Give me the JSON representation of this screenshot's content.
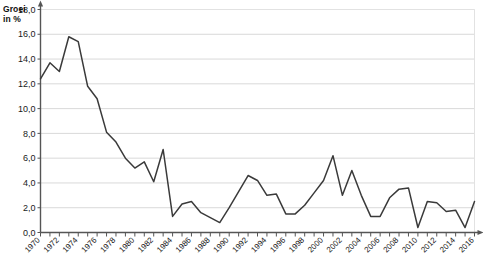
{
  "labels": {
    "axis_title_line1": "Groei",
    "axis_title_line2": "in %"
  },
  "chart_data": {
    "type": "line",
    "title": "",
    "subtitle": "",
    "xlabel": "",
    "ylabel": "Groei in %",
    "ylim": [
      0.0,
      18.0
    ],
    "ytick_step": 2.0,
    "ytick_labels": [
      "0,0",
      "2,0",
      "4,0",
      "6,0",
      "8,0",
      "10,0",
      "12,0",
      "14,0",
      "16,0",
      "18,0"
    ],
    "ytick_values": [
      0.0,
      2.0,
      4.0,
      6.0,
      8.0,
      10.0,
      12.0,
      14.0,
      16.0,
      18.0
    ],
    "xlim": [
      1970,
      2016
    ],
    "xtick_label_step": 2,
    "xtick_labels": [
      "1970",
      "1972",
      "1974",
      "1976",
      "1978",
      "1980",
      "1982",
      "1984",
      "1986",
      "1988",
      "1990",
      "1992",
      "1994",
      "1996",
      "1998",
      "2000",
      "2002",
      "2004",
      "2006",
      "2008",
      "2010",
      "2012",
      "2014",
      "2016"
    ],
    "grid": "horizontal",
    "legend_position": "none",
    "line_color": "#3a3a3a",
    "grid_color": "#d9d9d9",
    "axis_color": "#555555",
    "x": [
      1970,
      1971,
      1972,
      1973,
      1974,
      1975,
      1976,
      1977,
      1978,
      1979,
      1980,
      1981,
      1982,
      1983,
      1984,
      1985,
      1986,
      1987,
      1988,
      1989,
      1990,
      1991,
      1992,
      1993,
      1994,
      1995,
      1996,
      1997,
      1998,
      1999,
      2000,
      2001,
      2002,
      2003,
      2004,
      2005,
      2006,
      2007,
      2008,
      2009,
      2010,
      2011,
      2012,
      2013,
      2014,
      2015,
      2016
    ],
    "values": [
      12.4,
      13.7,
      13.0,
      15.8,
      15.4,
      11.8,
      10.8,
      8.1,
      7.3,
      6.0,
      5.2,
      5.7,
      4.1,
      6.7,
      1.3,
      2.3,
      2.5,
      1.6,
      1.2,
      0.8,
      2.0,
      3.3,
      4.6,
      4.2,
      3.0,
      3.1,
      1.5,
      1.5,
      2.2,
      3.2,
      4.2,
      6.2,
      3.0,
      5.0,
      3.0,
      1.3,
      1.3,
      2.8,
      3.5,
      3.6,
      0.4,
      2.5,
      2.4,
      1.7,
      1.8,
      0.4,
      2.5
    ]
  }
}
